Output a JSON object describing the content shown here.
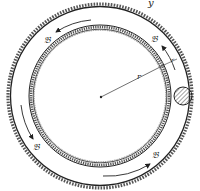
{
  "diagram": {
    "title_fragment": "y",
    "labels": {
      "radius": "r",
      "small_gap": "r",
      "point_label": "𝔅"
    },
    "points": [
      {
        "id": "top-left",
        "label": "𝔅"
      },
      {
        "id": "top-right",
        "label": "𝔅"
      },
      {
        "id": "bottom-left",
        "label": "𝔅"
      },
      {
        "id": "bottom-right",
        "label": "𝔅"
      }
    ],
    "colors": {
      "stroke": "#222222",
      "ball_fill": "#d8d8d8",
      "background": "#ffffff"
    },
    "geometry": {
      "center": [
        100,
        96
      ],
      "outer_radius": 90,
      "inner_radius": 69,
      "ball_radius": 9
    }
  }
}
